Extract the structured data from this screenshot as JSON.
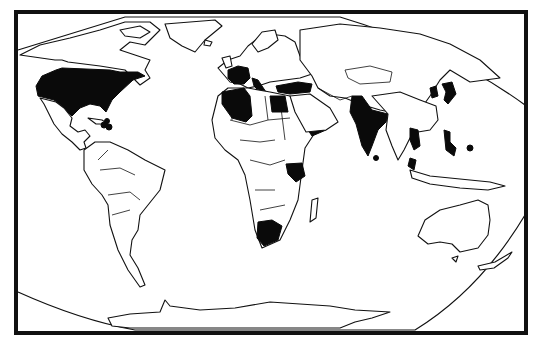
{
  "map": {
    "type": "world political outline map",
    "projection": "oval (Winkel-like) world projection",
    "style": "black and white line drawing",
    "colors": {
      "background": "#ffffff",
      "outline": "#111111",
      "highlight": "#0a0a0a",
      "frame": "#111111"
    },
    "highlighted_regions": [
      "United States",
      "Cuba / Caribbean islands",
      "France",
      "Italy",
      "Algeria",
      "Tunisia",
      "Libya (coast)",
      "Turkey",
      "Egypt",
      "Yemen",
      "Uganda",
      "Kenya",
      "South Africa",
      "India",
      "Sri Lanka",
      "Korea",
      "Japan",
      "Vietnam",
      "Malaysia",
      "Philippines"
    ],
    "unhighlighted_continents": [
      "Canada / Greenland",
      "Mexico / Central America",
      "South America",
      "Russia / Central Asia",
      "China / Mongolia",
      "Australia",
      "Antarctica"
    ]
  }
}
